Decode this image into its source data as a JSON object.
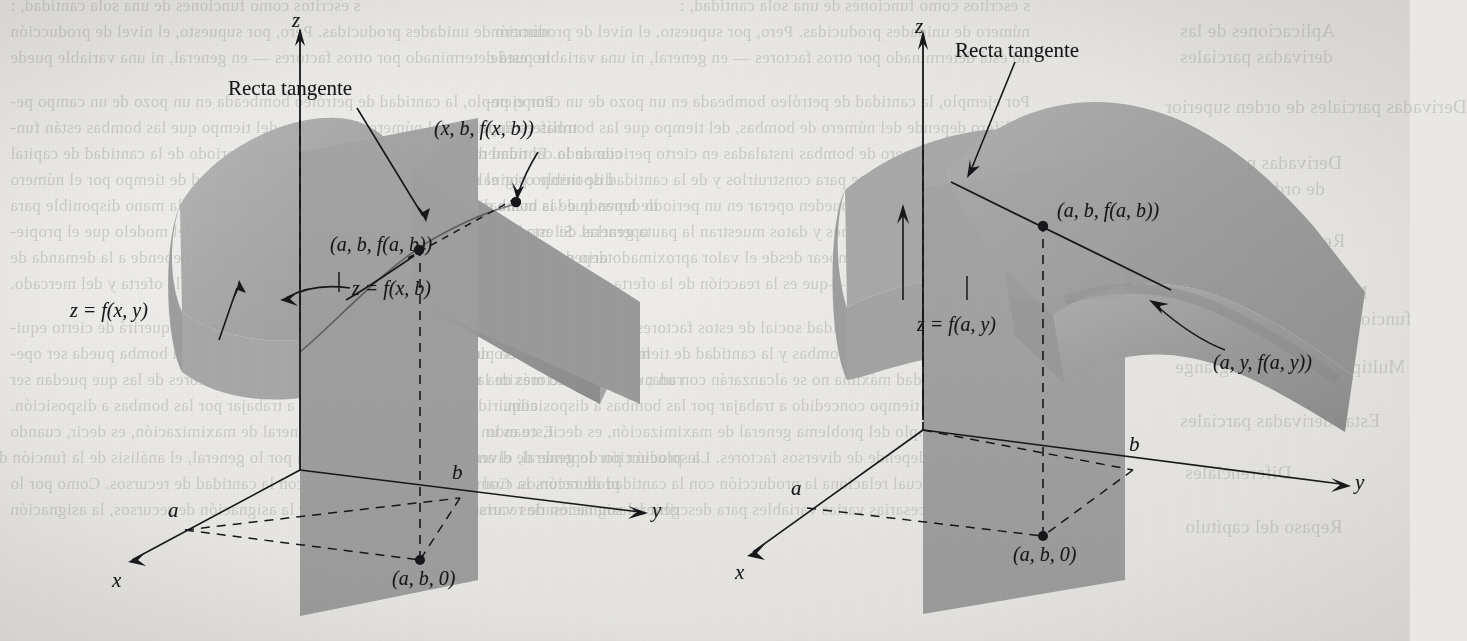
{
  "figure": {
    "caption_left": "",
    "caption_right": "",
    "surface_color": "#9c9c9c",
    "plane_color": "#8f8f8f",
    "ink_color": "#17161a",
    "paper_color": "#e9e8e6"
  },
  "left_panel": {
    "axes": {
      "z": "z",
      "x": "x",
      "y": "y"
    },
    "tick_a": "a",
    "tick_b": "b",
    "tangent_label": "Recta tangente",
    "point_upper": "(x, b, f(x, b))",
    "point_tangency": "(a, b, f(a, b))",
    "curve_label": "z = f(x, b)",
    "surface_label": "z = f(x, y)",
    "base_point": "(a, b, 0)"
  },
  "right_panel": {
    "axes": {
      "z": "z",
      "x": "x",
      "y": "y"
    },
    "tick_a": "a",
    "tick_b": "b",
    "tangent_label": "Recta tangente",
    "point_tangency": "(a, b, f(a, b))",
    "curve_point": "(a, y, f(a, y))",
    "plane_label": "z = f(a, y)",
    "base_point": "(a, b, 0)"
  },
  "show_through_text": {
    "left_top": [
      "s escritos como funciones de una sola cantidad, :",
      "número de unidades producidas.  Pero, por supuesto, el nivel de producción",
      "no está determinado por otros factores — en general, ni una variable puede"
    ],
    "left_mid": [
      "Por ejemplo, la cantidad de petróleo bombeada en un pozo de un campo pe-",
      "trolífero depende del número de bombas, del tiempo que las bombas están fun-",
      "cionando. El número de bombas instaladas en cierto periodo de la cantidad de capital",
      "disponible originalmente para construirlos y de la cantidad de tiempo por el número",
      "de horas que las bombas pueden operar en un periodo depende de la mano disponible para",
      "operarlas. Si estas funciones y datos muestran la pauta general del modelo que el propie-",
      "tario del campo desea bombear desde el valor aproximado depende a la demanda de",
      "petróleo o en tiempo real —que es la reacción de la oferta y del mercado."
    ],
    "left_bot": [
      "La maximización de la utilidad social de estos factores requerirá de cierto equi-",
      "librio entre el número de bombas y la cantidad de tiempo que cada bomba pueda ser ope-",
      "rada; esta cantidad máxima no se alcanzarán con un número de factores de las que puedan ser",
      "adquiridas y el tiempo concedido a trabajar por las bombas a disposición.",
      "Este es un ejemplo del problema general de maximización, es decir, cuando",
      "la producción depende de diversos factores. La solución por lo general, el análisis de la función de",
      "producción, la cual relaciona la producción con la cantidad de recursos. Como por lo",
      "general son necesarias varias variables para describir la asignación de recursos, la asignación"
    ],
    "right_col": [
      "Aplicaciones de las",
      "derivadas parciales",
      "Derivadas parciales de orden superior",
      "Derivadas parciales",
      "de orden superior",
      "Regla de la cadena",
      "Máximos y mínimos de",
      "funciones de varias variables",
      "Multiplicadores de Lagrange",
      "Estas derivadas parciales",
      "Diferenciales",
      "Repaso del capítulo"
    ]
  }
}
